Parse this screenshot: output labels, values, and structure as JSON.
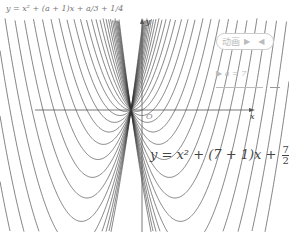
{
  "formula_top": "y = x² + (a + 1)x + a/3 + 1/4",
  "animation": {
    "label": "动画",
    "play_icon": "▶",
    "reverse_icon": "◀"
  },
  "slider": {
    "icon": "▶",
    "label": "a = 7"
  },
  "axes": {
    "x_label": "x",
    "y_label": "y",
    "origin_label": "O"
  },
  "formula_bottom": {
    "prefix": "y = x² + (7 + 1)x + ",
    "frac1_num": "7",
    "frac1_den": "2",
    "plus": " + ",
    "frac2_num": "1",
    "frac2_den": "4"
  },
  "plot": {
    "origin_px": [
      142,
      110
    ],
    "scale": 22,
    "a_min": -7,
    "a_max": 7,
    "a_step": 0.5,
    "curve_color": "#333333",
    "axis_color": "#555555"
  }
}
